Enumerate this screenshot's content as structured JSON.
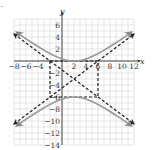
{
  "chart_data": {
    "type": "line",
    "title": "",
    "xlabel": "x",
    "ylabel": "y",
    "xlim": [
      -8,
      12
    ],
    "ylim": [
      -14,
      7
    ],
    "grid": true,
    "x_ticks": [
      -8,
      -6,
      -4,
      2,
      4,
      8,
      10,
      12
    ],
    "x_tick_labels": [
      "−8",
      "−6",
      "−4",
      "2",
      "4",
      "8",
      "10",
      "12"
    ],
    "y_ticks": [
      6,
      4,
      2,
      -2,
      -4,
      -6,
      -8,
      -10,
      -12,
      -14
    ],
    "y_tick_labels": [
      "6",
      "4",
      "2",
      "−2",
      "−4",
      "−6",
      "−8",
      "−10",
      "−12",
      "−14"
    ],
    "extra_x_label": {
      "x": 6,
      "label": "6"
    },
    "hyperbola": {
      "equation": "(y+3)^2/9 - (x-2)^2/16 = 1",
      "center": [
        2,
        -3
      ],
      "a": 3,
      "b": 4,
      "orientation": "vertical",
      "vertices": [
        [
          2,
          0
        ],
        [
          2,
          -6
        ]
      ],
      "color": "#999999"
    },
    "asymptotes": [
      {
        "equation": "y + 3 = (3/4)(x - 2)",
        "from": [
          -8,
          -10.5
        ],
        "to": [
          12,
          4.5
        ],
        "style": "dashed"
      },
      {
        "equation": "y + 3 = -(3/4)(x - 2)",
        "from": [
          -8,
          4.5
        ],
        "to": [
          12,
          -10.5
        ],
        "style": "dashed"
      }
    ],
    "fundamental_rectangle": {
      "corners": [
        [
          -2,
          0
        ],
        [
          6,
          0
        ],
        [
          6,
          -6
        ],
        [
          -2,
          -6
        ]
      ],
      "style": "dashed"
    }
  },
  "labels": {
    "x_axis": "x",
    "y_axis": "y",
    "corner_mark": "."
  }
}
